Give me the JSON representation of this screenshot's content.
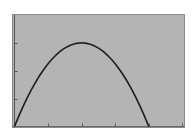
{
  "chart_data": {
    "type": "line",
    "title": "",
    "xlabel": "",
    "ylabel": "",
    "grid": false,
    "legend": null,
    "x_ticks": [
      0,
      1,
      2,
      3,
      4,
      5
    ],
    "y_ticks": [
      0,
      1,
      2,
      3
    ],
    "xlim": [
      0,
      5.05
    ],
    "ylim": [
      0,
      4
    ],
    "series": [
      {
        "name": "parabola",
        "x": [
          0,
          0.5,
          1,
          1.5,
          2,
          2.5,
          3,
          3.5,
          4
        ],
        "y": [
          0,
          1.3125,
          2.25,
          2.8125,
          3,
          2.8125,
          2.25,
          1.3125,
          0
        ]
      }
    ],
    "colors": {
      "background": "#ffffff",
      "plot_area": "#b4b4b4",
      "frame": "#8a8a8a",
      "axis": "#555555",
      "curve": "#1e1e1e"
    }
  }
}
